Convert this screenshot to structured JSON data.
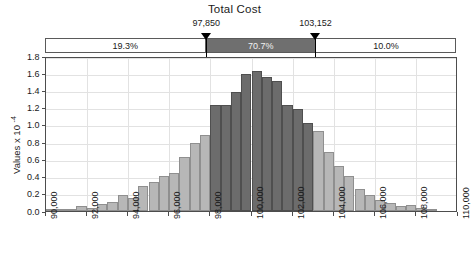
{
  "chart": {
    "title": "Total Cost",
    "ylabel_text": "Values x 10",
    "ylabel_exp": "-4"
  },
  "markers": {
    "left": {
      "value_label": "97,850",
      "value": 97850
    },
    "right": {
      "value_label": "103,152",
      "value": 103152
    }
  },
  "bands": [
    {
      "name": "left-band",
      "label": "19.3%",
      "percent": 19.3
    },
    {
      "name": "middle-band",
      "label": "70.7%",
      "percent": 70.7
    },
    {
      "name": "right-band",
      "label": "10.0%",
      "percent": 10.0
    }
  ],
  "yticks": [
    "0.0",
    "0.2",
    "0.4",
    "0.6",
    "0.8",
    "1.0",
    "1.2",
    "1.4",
    "1.6",
    "1.8"
  ],
  "xticks": [
    "90,000",
    "92,000",
    "94,000",
    "96,000",
    "98,000",
    "100,000",
    "102,000",
    "104,000",
    "106,000",
    "108,000",
    "110,000"
  ],
  "chart_data": {
    "type": "bar",
    "title": "Total Cost",
    "xlabel": "",
    "ylabel": "Values x 10^-4",
    "xlim": [
      90000,
      110000
    ],
    "ylim": [
      0.0,
      1.8
    ],
    "grid": true,
    "legend": null,
    "bin_width": 500,
    "annotations": [
      {
        "type": "vertical-marker",
        "x": 97850,
        "label": "97,850"
      },
      {
        "type": "vertical-marker",
        "x": 103152,
        "label": "103,152"
      },
      {
        "type": "region-percent",
        "from": 90000,
        "to": 97850,
        "label": "19.3%"
      },
      {
        "type": "region-percent",
        "from": 97850,
        "to": 103152,
        "label": "70.7%"
      },
      {
        "type": "region-percent",
        "from": 103152,
        "to": 110000,
        "label": "10.0%"
      }
    ],
    "bins": [
      {
        "x0": 90000,
        "x1": 90500,
        "value": 0.01
      },
      {
        "x0": 90500,
        "x1": 91000,
        "value": 0.01
      },
      {
        "x0": 91000,
        "x1": 91500,
        "value": 0.02
      },
      {
        "x0": 91500,
        "x1": 92000,
        "value": 0.05
      },
      {
        "x0": 92000,
        "x1": 92500,
        "value": 0.03
      },
      {
        "x0": 92500,
        "x1": 93000,
        "value": 0.08
      },
      {
        "x0": 93000,
        "x1": 93500,
        "value": 0.1
      },
      {
        "x0": 93500,
        "x1": 94000,
        "value": 0.18
      },
      {
        "x0": 94000,
        "x1": 94500,
        "value": 0.15
      },
      {
        "x0": 94500,
        "x1": 95000,
        "value": 0.28
      },
      {
        "x0": 95000,
        "x1": 95500,
        "value": 0.33
      },
      {
        "x0": 95500,
        "x1": 96000,
        "value": 0.4
      },
      {
        "x0": 96000,
        "x1": 96500,
        "value": 0.43
      },
      {
        "x0": 96500,
        "x1": 97000,
        "value": 0.62
      },
      {
        "x0": 97000,
        "x1": 97500,
        "value": 0.78
      },
      {
        "x0": 97500,
        "x1": 98000,
        "value": 0.88
      },
      {
        "x0": 98000,
        "x1": 98500,
        "value": 1.22
      },
      {
        "x0": 98500,
        "x1": 99000,
        "value": 1.22
      },
      {
        "x0": 99000,
        "x1": 99500,
        "value": 1.38
      },
      {
        "x0": 99500,
        "x1": 100000,
        "value": 1.58
      },
      {
        "x0": 100000,
        "x1": 100500,
        "value": 1.62
      },
      {
        "x0": 100500,
        "x1": 101000,
        "value": 1.55
      },
      {
        "x0": 101000,
        "x1": 101500,
        "value": 1.5
      },
      {
        "x0": 101500,
        "x1": 102000,
        "value": 1.22
      },
      {
        "x0": 102000,
        "x1": 102500,
        "value": 1.18
      },
      {
        "x0": 102500,
        "x1": 103000,
        "value": 1.02
      },
      {
        "x0": 103000,
        "x1": 103500,
        "value": 0.92
      },
      {
        "x0": 103500,
        "x1": 104000,
        "value": 0.68
      },
      {
        "x0": 104000,
        "x1": 104500,
        "value": 0.52
      },
      {
        "x0": 104500,
        "x1": 105000,
        "value": 0.4
      },
      {
        "x0": 105000,
        "x1": 105500,
        "value": 0.25
      },
      {
        "x0": 105500,
        "x1": 106000,
        "value": 0.18
      },
      {
        "x0": 106000,
        "x1": 106500,
        "value": 0.12
      },
      {
        "x0": 106500,
        "x1": 107000,
        "value": 0.09
      },
      {
        "x0": 107000,
        "x1": 107500,
        "value": 0.05
      },
      {
        "x0": 107500,
        "x1": 108000,
        "value": 0.06
      },
      {
        "x0": 108000,
        "x1": 108500,
        "value": 0.03
      },
      {
        "x0": 108500,
        "x1": 109000,
        "value": 0.01
      },
      {
        "x0": 109000,
        "x1": 109500,
        "value": 0.0
      },
      {
        "x0": 109500,
        "x1": 110000,
        "value": 0.0
      }
    ]
  }
}
